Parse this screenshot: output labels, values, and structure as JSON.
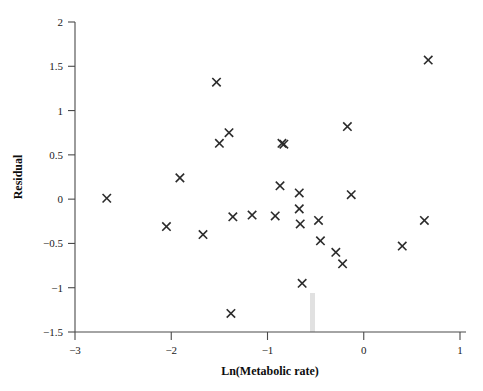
{
  "chart_data": {
    "type": "scatter",
    "title": "",
    "xlabel": "Ln(Metabolic rate)",
    "ylabel": "Residual",
    "xlim": [
      -3,
      1
    ],
    "ylim": [
      -1.5,
      2
    ],
    "xticks": [
      -3,
      -2,
      -1,
      0,
      1
    ],
    "xtick_labels": [
      "−3",
      "−2",
      "−1",
      "0",
      "1"
    ],
    "yticks": [
      -1.5,
      -1,
      -0.5,
      0,
      0.5,
      1,
      1.5,
      2
    ],
    "ytick_labels": [
      "−1.5",
      "−1",
      "−0.5",
      "0",
      "0.5",
      "1",
      "1.5",
      "2"
    ],
    "grid": false,
    "legend": null,
    "marker": "x",
    "marker_color": "#2b2b2b",
    "n_points": 31,
    "points": [
      {
        "x": -2.67,
        "y": 0.01
      },
      {
        "x": -2.05,
        "y": -0.31
      },
      {
        "x": -1.91,
        "y": 0.24
      },
      {
        "x": -1.67,
        "y": -0.4
      },
      {
        "x": -1.53,
        "y": 1.32
      },
      {
        "x": -1.5,
        "y": 0.63
      },
      {
        "x": -1.4,
        "y": 0.75
      },
      {
        "x": -1.38,
        "y": -1.29
      },
      {
        "x": -1.36,
        "y": -0.2
      },
      {
        "x": -1.16,
        "y": -0.18
      },
      {
        "x": -0.92,
        "y": -0.19
      },
      {
        "x": -0.87,
        "y": 0.15
      },
      {
        "x": -0.85,
        "y": 0.63
      },
      {
        "x": -0.83,
        "y": 0.62
      },
      {
        "x": -0.67,
        "y": 0.07
      },
      {
        "x": -0.67,
        "y": -0.11
      },
      {
        "x": -0.66,
        "y": -0.28
      },
      {
        "x": -0.64,
        "y": -0.95
      },
      {
        "x": -0.47,
        "y": -0.24
      },
      {
        "x": -0.45,
        "y": -0.47
      },
      {
        "x": -0.29,
        "y": -0.6
      },
      {
        "x": -0.22,
        "y": -0.73
      },
      {
        "x": -0.17,
        "y": 0.82
      },
      {
        "x": -0.13,
        "y": 0.05
      },
      {
        "x": 0.4,
        "y": -0.53
      },
      {
        "x": 0.63,
        "y": -0.24
      },
      {
        "x": 0.67,
        "y": 1.57
      }
    ]
  },
  "axes": {
    "x_title": "Ln(Metabolic rate)",
    "y_title": "Residual"
  }
}
